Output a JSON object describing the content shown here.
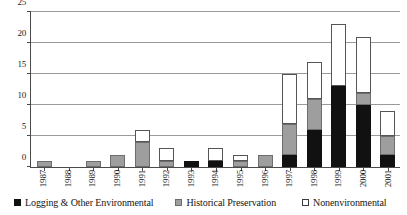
{
  "chart_data": {
    "type": "bar",
    "stacked": true,
    "title": "",
    "subtitle": "",
    "xlabel": "",
    "ylabel": "",
    "ylim": [
      0,
      25
    ],
    "yticks": [
      0,
      5,
      10,
      15,
      20,
      25
    ],
    "grid": true,
    "legend_position": "bottom",
    "categories": [
      "1987",
      "1988",
      "1989",
      "1990",
      "1991",
      "1992",
      "1993",
      "1994",
      "1995",
      "1996",
      "1997",
      "1998",
      "1999",
      "2000",
      "2001"
    ],
    "series": [
      {
        "name": "Logging & Other Environmental",
        "color": "#111111",
        "values": [
          0,
          0,
          0,
          0,
          0,
          0,
          1,
          1,
          0,
          0,
          2,
          6,
          13,
          10,
          2
        ]
      },
      {
        "name": "Historical Preservation",
        "color": "#9e9e9e",
        "values": [
          1,
          0,
          1,
          2,
          4,
          1,
          0,
          0,
          1,
          2,
          5,
          5,
          0,
          2,
          3
        ]
      },
      {
        "name": "Nonenvironmental",
        "color": "#ffffff",
        "values": [
          0,
          0,
          0,
          0,
          2,
          2,
          0,
          2,
          1,
          0,
          8,
          6,
          10,
          9,
          4
        ]
      }
    ],
    "totals": [
      1,
      0,
      1,
      2,
      6,
      3,
      1,
      3,
      2,
      2,
      15,
      17,
      23,
      21,
      9
    ]
  },
  "legend": {
    "items": [
      {
        "label": "Logging & Other Environmental",
        "swatch": "black-square-icon"
      },
      {
        "label": "Historical Preservation",
        "swatch": "gray-square-icon"
      },
      {
        "label": "Nonenvironmental",
        "swatch": "white-square-icon"
      }
    ]
  }
}
